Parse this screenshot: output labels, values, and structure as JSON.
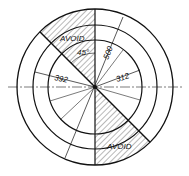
{
  "diagram": {
    "type": "circular-zone-drawing",
    "center": {
      "x": 95,
      "y": 87
    },
    "circles": [
      {
        "r": 78
      },
      {
        "r": 62
      },
      {
        "r": 47
      }
    ],
    "hatched_zones": [
      {
        "label": "AVOID",
        "position": "upper-left"
      },
      {
        "label": "AVOID",
        "position": "lower-right"
      }
    ],
    "dimensions": {
      "angle": "45°",
      "radius_outer": "500",
      "radius_left": "392",
      "radius_right": "312"
    },
    "colors": {
      "line": "#111111",
      "background": "#ffffff"
    }
  }
}
